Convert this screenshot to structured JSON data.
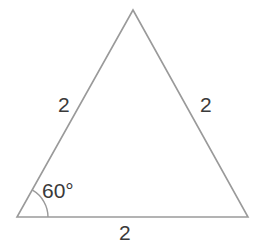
{
  "figure": {
    "kind": "geometry-diagram",
    "shape": "equilateral-triangle",
    "background_color": "#ffffff",
    "stroke_color": "#9a9a9a",
    "text_color": "#3a3a3a",
    "stroke_width": 1.6
  },
  "triangle": {
    "vertices": {
      "apex": {
        "x": 133,
        "y": 10
      },
      "bottom_left": {
        "x": 17,
        "y": 217
      },
      "bottom_right": {
        "x": 248,
        "y": 217
      }
    },
    "path": "M 133 10 L 248 217 L 17 217 Z"
  },
  "angle_marker": {
    "vertex": {
      "x": 17,
      "y": 217
    },
    "radius": 31,
    "arc_path": "M 48 217 A 31 31 0 0 0 32.5 190.2",
    "measure_label": "60°",
    "measure_value": 60,
    "unit": "degrees"
  },
  "labels": {
    "left_side": "2",
    "right_side": "2",
    "bottom_side": "2",
    "angle": "60°"
  },
  "chart_data": {
    "type": "diagram",
    "title": "",
    "shape": "equilateral triangle",
    "side_lengths": [
      {
        "side": "left",
        "label": "2",
        "value": 2
      },
      {
        "side": "right",
        "label": "2",
        "value": 2
      },
      {
        "side": "bottom",
        "label": "2",
        "value": 2
      }
    ],
    "angles": [
      {
        "vertex": "bottom-left",
        "label": "60°",
        "value": 60,
        "marked": true
      }
    ]
  }
}
